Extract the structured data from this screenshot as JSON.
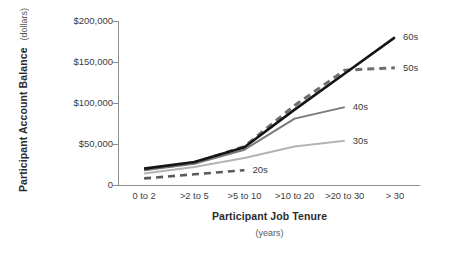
{
  "chart_data": {
    "type": "line",
    "title": "",
    "xlabel": "Participant Job Tenure",
    "xlabel_sub": "(years)",
    "ylabel": "Participant Account Balance",
    "ylabel_sub": "(dollars)",
    "categories": [
      "0 to 2",
      ">2 to 5",
      ">5 to 10",
      ">10 to 20",
      ">20 to 30",
      "> 30"
    ],
    "ylim": [
      0,
      200000
    ],
    "yticks": [
      0,
      50000,
      100000,
      150000,
      200000
    ],
    "ytick_labels": [
      "0",
      "$50,000",
      "$100,000",
      "$150,000",
      "$200,000"
    ],
    "grid": false,
    "legend": "inline-right-of-line-ends",
    "series": [
      {
        "name": "20s",
        "label": "20s",
        "color": "#595959",
        "style": "dashed",
        "width": 2.6,
        "values": [
          8000,
          13000,
          18000,
          null,
          null,
          null
        ],
        "label_x": 0.5,
        "label_y": 18000
      },
      {
        "name": "30s",
        "label": "30s",
        "color": "#b4b4b4",
        "style": "solid",
        "width": 2.0,
        "values": [
          14000,
          22000,
          33000,
          47000,
          54000,
          null
        ],
        "label_x": 0.5,
        "label_y": 54000
      },
      {
        "name": "40s",
        "label": "40s",
        "color": "#7a7a7a",
        "style": "solid",
        "width": 2.0,
        "values": [
          18000,
          26000,
          43000,
          81000,
          95000,
          null
        ],
        "label_x": 0.5,
        "label_y": 95000
      },
      {
        "name": "50s",
        "label": "50s",
        "color": "#6e6e6e",
        "style": "dashed",
        "width": 3.0,
        "values": [
          19000,
          27000,
          47000,
          97000,
          140000,
          143000
        ],
        "label_x": 0.4,
        "label_y": 143000
      },
      {
        "name": "60s",
        "label": "60s",
        "color": "#141414",
        "style": "solid",
        "width": 2.6,
        "values": [
          20000,
          28000,
          46000,
          92000,
          136000,
          180000
        ],
        "label_x": 0.4,
        "label_y": 180000
      }
    ]
  },
  "axes": {
    "x_title": "Participant Job Tenure",
    "x_subtitle": "(years)",
    "y_title": "Participant Account Balance",
    "y_subtitle": "(dollars)"
  },
  "colors": {
    "axis": "#8d8d8d",
    "text": "#3c3c3c",
    "title": "#2b2b2b",
    "background": "#ffffff"
  }
}
